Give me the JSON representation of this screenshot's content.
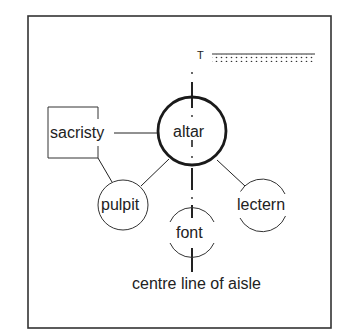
{
  "diagram": {
    "type": "church layout relationship diagram",
    "nodes": [
      {
        "id": "altar",
        "label": "altar",
        "shape": "circle-bold"
      },
      {
        "id": "sacristy",
        "label": "sacristy",
        "shape": "square"
      },
      {
        "id": "pulpit",
        "label": "pulpit",
        "shape": "circle"
      },
      {
        "id": "lectern",
        "label": "lectern",
        "shape": "circle-broken"
      },
      {
        "id": "font",
        "label": "font",
        "shape": "circle-broken"
      }
    ],
    "edges": [
      {
        "from": "sacristy",
        "to": "altar"
      },
      {
        "from": "sacristy",
        "to": "pulpit"
      },
      {
        "from": "altar",
        "to": "pulpit"
      },
      {
        "from": "altar",
        "to": "lectern"
      }
    ],
    "axis": {
      "label": "centre line of aisle"
    },
    "marker": {
      "label": "T"
    },
    "colors": {
      "ink": "#222222",
      "background": "#ffffff",
      "frame": "#333333"
    }
  }
}
